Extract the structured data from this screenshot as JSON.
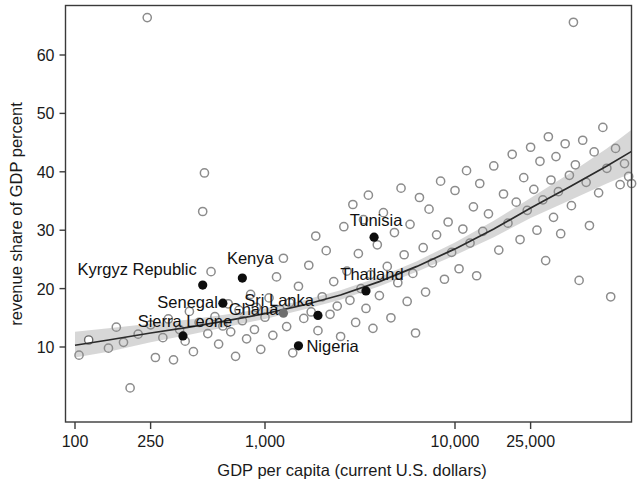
{
  "chart_data": {
    "type": "scatter",
    "title": "",
    "xlabel": "GDP per capita (current U.S. dollars)",
    "ylabel": "revenue share of GDP percent",
    "xscale": "log",
    "yscale": "linear",
    "grid": false,
    "legend": null,
    "xticks": [
      100,
      250,
      1000,
      10000,
      25000
    ],
    "xtick_labels": [
      "100",
      "250",
      "1,000",
      "10,000",
      "25,000"
    ],
    "yticks": [
      10,
      20,
      30,
      40,
      50,
      60
    ],
    "ytick_labels": [
      "10",
      "20",
      "30",
      "40",
      "50",
      "60"
    ],
    "xlim": [
      90,
      90000
    ],
    "ylim": [
      2,
      67
    ],
    "annotations": [
      {
        "label": "Kyrgyz Republic",
        "x": 470,
        "y": 20.6,
        "marker": "solid",
        "label_anchor": "end",
        "label_dx": -6,
        "label_dy": -10
      },
      {
        "label": "Kenya",
        "x": 760,
        "y": 21.8,
        "marker": "solid",
        "label_anchor": "middle",
        "label_dx": 8,
        "label_dy": -14
      },
      {
        "label": "Senegal",
        "x": 600,
        "y": 17.5,
        "marker": "solid",
        "label_anchor": "end",
        "label_dx": -5,
        "label_dy": 5
      },
      {
        "label": "Sierra Leone",
        "x": 370,
        "y": 11.9,
        "marker": "solid",
        "label_anchor": "middle",
        "label_dx": 2,
        "label_dy": -9
      },
      {
        "label": "Ghana",
        "x": 1250,
        "y": 15.8,
        "marker": "gray",
        "label_anchor": "end",
        "label_dx": -5,
        "label_dy": 2
      },
      {
        "label": "Sri Lanka",
        "x": 1900,
        "y": 15.4,
        "marker": "solid",
        "label_anchor": "end",
        "label_dx": -4,
        "label_dy": -9
      },
      {
        "label": "Nigeria",
        "x": 1500,
        "y": 10.2,
        "marker": "solid",
        "label_anchor": "start",
        "label_dx": 8,
        "label_dy": 6
      },
      {
        "label": "Thailand",
        "x": 3400,
        "y": 19.6,
        "marker": "solid",
        "label_anchor": "middle",
        "label_dx": 6,
        "label_dy": -11
      },
      {
        "label": "Tunisia",
        "x": 3750,
        "y": 28.8,
        "marker": "solid",
        "label_anchor": "middle",
        "label_dx": 2,
        "label_dy": -11
      }
    ],
    "fit_line": {
      "description": "fitted regression curve with shaded confidence band",
      "x": [
        100,
        150,
        250,
        400,
        600,
        1000,
        1600,
        2500,
        4000,
        6300,
        10000,
        16000,
        25000,
        40000,
        63000,
        85000
      ],
      "y": [
        10.3,
        11.2,
        12.4,
        13.4,
        14.4,
        15.7,
        17.2,
        18.9,
        21.2,
        23.8,
        26.8,
        30.2,
        33.8,
        37.4,
        41.0,
        43.5
      ],
      "band_upper": [
        12.6,
        13.2,
        14.0,
        14.7,
        15.5,
        16.6,
        18.0,
        19.7,
        22.0,
        24.7,
        27.9,
        31.6,
        35.5,
        39.7,
        44.0,
        47.2
      ],
      "band_lower": [
        8.2,
        9.2,
        10.8,
        12.1,
        13.3,
        14.8,
        16.4,
        18.1,
        20.4,
        22.9,
        25.7,
        28.8,
        32.1,
        35.1,
        38.0,
        39.8
      ]
    },
    "points": [
      {
        "x": 105,
        "y": 8.6,
        "marker": "hollow"
      },
      {
        "x": 118,
        "y": 11.2,
        "marker": "white"
      },
      {
        "x": 150,
        "y": 9.8,
        "marker": "hollow"
      },
      {
        "x": 165,
        "y": 13.4,
        "marker": "hollow"
      },
      {
        "x": 180,
        "y": 10.8,
        "marker": "hollow"
      },
      {
        "x": 195,
        "y": 3.0,
        "marker": "hollow"
      },
      {
        "x": 215,
        "y": 12.2,
        "marker": "hollow"
      },
      {
        "x": 240,
        "y": 66.4,
        "marker": "hollow"
      },
      {
        "x": 250,
        "y": 13.8,
        "marker": "hollow"
      },
      {
        "x": 265,
        "y": 8.2,
        "marker": "hollow"
      },
      {
        "x": 290,
        "y": 11.6,
        "marker": "hollow"
      },
      {
        "x": 310,
        "y": 14.8,
        "marker": "hollow"
      },
      {
        "x": 330,
        "y": 7.8,
        "marker": "hollow"
      },
      {
        "x": 355,
        "y": 13.0,
        "marker": "hollow"
      },
      {
        "x": 380,
        "y": 11.0,
        "marker": "hollow"
      },
      {
        "x": 400,
        "y": 16.1,
        "marker": "hollow"
      },
      {
        "x": 420,
        "y": 9.2,
        "marker": "hollow"
      },
      {
        "x": 450,
        "y": 14.2,
        "marker": "hollow"
      },
      {
        "x": 470,
        "y": 33.2,
        "marker": "hollow"
      },
      {
        "x": 480,
        "y": 39.8,
        "marker": "hollow"
      },
      {
        "x": 500,
        "y": 12.3,
        "marker": "hollow"
      },
      {
        "x": 520,
        "y": 22.9,
        "marker": "hollow"
      },
      {
        "x": 545,
        "y": 15.2,
        "marker": "hollow"
      },
      {
        "x": 570,
        "y": 10.5,
        "marker": "hollow"
      },
      {
        "x": 600,
        "y": 13.6,
        "marker": "hollow"
      },
      {
        "x": 640,
        "y": 17.4,
        "marker": "hollow"
      },
      {
        "x": 660,
        "y": 12.6,
        "marker": "hollow"
      },
      {
        "x": 700,
        "y": 8.4,
        "marker": "hollow"
      },
      {
        "x": 730,
        "y": 16.3,
        "marker": "hollow"
      },
      {
        "x": 760,
        "y": 14.5,
        "marker": "hollow"
      },
      {
        "x": 800,
        "y": 11.4,
        "marker": "hollow"
      },
      {
        "x": 840,
        "y": 19.0,
        "marker": "hollow"
      },
      {
        "x": 880,
        "y": 13.0,
        "marker": "hollow"
      },
      {
        "x": 900,
        "y": 16.8,
        "marker": "hollow"
      },
      {
        "x": 950,
        "y": 9.6,
        "marker": "hollow"
      },
      {
        "x": 1000,
        "y": 15.1,
        "marker": "hollow"
      },
      {
        "x": 1050,
        "y": 18.4,
        "marker": "hollow"
      },
      {
        "x": 1100,
        "y": 12.0,
        "marker": "hollow"
      },
      {
        "x": 1150,
        "y": 22.0,
        "marker": "hollow"
      },
      {
        "x": 1200,
        "y": 16.4,
        "marker": "hollow"
      },
      {
        "x": 1250,
        "y": 25.2,
        "marker": "hollow"
      },
      {
        "x": 1300,
        "y": 13.5,
        "marker": "hollow"
      },
      {
        "x": 1350,
        "y": 17.6,
        "marker": "hollow"
      },
      {
        "x": 1400,
        "y": 9.0,
        "marker": "hollow"
      },
      {
        "x": 1500,
        "y": 20.4,
        "marker": "hollow"
      },
      {
        "x": 1600,
        "y": 14.9,
        "marker": "hollow"
      },
      {
        "x": 1700,
        "y": 24.0,
        "marker": "hollow"
      },
      {
        "x": 1750,
        "y": 16.0,
        "marker": "hollow"
      },
      {
        "x": 1850,
        "y": 29.0,
        "marker": "hollow"
      },
      {
        "x": 1900,
        "y": 12.8,
        "marker": "hollow"
      },
      {
        "x": 2000,
        "y": 18.6,
        "marker": "hollow"
      },
      {
        "x": 2100,
        "y": 26.5,
        "marker": "hollow"
      },
      {
        "x": 2200,
        "y": 15.6,
        "marker": "hollow"
      },
      {
        "x": 2300,
        "y": 21.2,
        "marker": "hollow"
      },
      {
        "x": 2400,
        "y": 17.0,
        "marker": "hollow"
      },
      {
        "x": 2500,
        "y": 11.8,
        "marker": "hollow"
      },
      {
        "x": 2600,
        "y": 30.6,
        "marker": "hollow"
      },
      {
        "x": 2700,
        "y": 23.0,
        "marker": "hollow"
      },
      {
        "x": 2800,
        "y": 18.0,
        "marker": "hollow"
      },
      {
        "x": 2900,
        "y": 34.4,
        "marker": "hollow"
      },
      {
        "x": 3000,
        "y": 14.2,
        "marker": "hollow"
      },
      {
        "x": 3100,
        "y": 26.0,
        "marker": "hollow"
      },
      {
        "x": 3200,
        "y": 20.0,
        "marker": "hollow"
      },
      {
        "x": 3300,
        "y": 31.8,
        "marker": "hollow"
      },
      {
        "x": 3400,
        "y": 16.6,
        "marker": "hollow"
      },
      {
        "x": 3500,
        "y": 36.0,
        "marker": "hollow"
      },
      {
        "x": 3600,
        "y": 22.4,
        "marker": "hollow"
      },
      {
        "x": 3700,
        "y": 13.2,
        "marker": "hollow"
      },
      {
        "x": 3900,
        "y": 27.5,
        "marker": "hollow"
      },
      {
        "x": 4000,
        "y": 18.8,
        "marker": "hollow"
      },
      {
        "x": 4200,
        "y": 33.0,
        "marker": "hollow"
      },
      {
        "x": 4400,
        "y": 23.8,
        "marker": "hollow"
      },
      {
        "x": 4600,
        "y": 15.0,
        "marker": "hollow"
      },
      {
        "x": 4800,
        "y": 29.6,
        "marker": "hollow"
      },
      {
        "x": 5000,
        "y": 21.0,
        "marker": "hollow"
      },
      {
        "x": 5200,
        "y": 37.2,
        "marker": "hollow"
      },
      {
        "x": 5400,
        "y": 25.8,
        "marker": "hollow"
      },
      {
        "x": 5600,
        "y": 17.8,
        "marker": "hollow"
      },
      {
        "x": 5800,
        "y": 31.0,
        "marker": "hollow"
      },
      {
        "x": 6000,
        "y": 22.6,
        "marker": "hollow"
      },
      {
        "x": 6200,
        "y": 12.4,
        "marker": "hollow"
      },
      {
        "x": 6500,
        "y": 35.6,
        "marker": "hollow"
      },
      {
        "x": 6800,
        "y": 27.0,
        "marker": "hollow"
      },
      {
        "x": 7000,
        "y": 19.4,
        "marker": "hollow"
      },
      {
        "x": 7300,
        "y": 33.6,
        "marker": "hollow"
      },
      {
        "x": 7600,
        "y": 24.4,
        "marker": "hollow"
      },
      {
        "x": 8000,
        "y": 29.2,
        "marker": "hollow"
      },
      {
        "x": 8400,
        "y": 38.4,
        "marker": "hollow"
      },
      {
        "x": 8800,
        "y": 21.6,
        "marker": "hollow"
      },
      {
        "x": 9200,
        "y": 31.4,
        "marker": "hollow"
      },
      {
        "x": 9600,
        "y": 26.2,
        "marker": "hollow"
      },
      {
        "x": 10000,
        "y": 36.8,
        "marker": "hollow"
      },
      {
        "x": 10500,
        "y": 23.4,
        "marker": "hollow"
      },
      {
        "x": 11000,
        "y": 30.2,
        "marker": "hollow"
      },
      {
        "x": 11500,
        "y": 40.2,
        "marker": "hollow"
      },
      {
        "x": 12000,
        "y": 27.8,
        "marker": "hollow"
      },
      {
        "x": 12500,
        "y": 34.0,
        "marker": "hollow"
      },
      {
        "x": 13000,
        "y": 22.2,
        "marker": "hollow"
      },
      {
        "x": 13500,
        "y": 38.0,
        "marker": "hollow"
      },
      {
        "x": 14000,
        "y": 29.8,
        "marker": "hollow"
      },
      {
        "x": 15000,
        "y": 32.8,
        "marker": "hollow"
      },
      {
        "x": 16000,
        "y": 41.0,
        "marker": "hollow"
      },
      {
        "x": 17000,
        "y": 26.6,
        "marker": "hollow"
      },
      {
        "x": 18000,
        "y": 36.2,
        "marker": "hollow"
      },
      {
        "x": 19000,
        "y": 31.2,
        "marker": "hollow"
      },
      {
        "x": 20000,
        "y": 43.0,
        "marker": "hollow"
      },
      {
        "x": 21000,
        "y": 34.8,
        "marker": "hollow"
      },
      {
        "x": 22000,
        "y": 28.4,
        "marker": "hollow"
      },
      {
        "x": 23000,
        "y": 39.0,
        "marker": "hollow"
      },
      {
        "x": 24000,
        "y": 33.4,
        "marker": "hollow"
      },
      {
        "x": 25000,
        "y": 44.2,
        "marker": "hollow"
      },
      {
        "x": 26000,
        "y": 37.0,
        "marker": "hollow"
      },
      {
        "x": 27000,
        "y": 30.0,
        "marker": "hollow"
      },
      {
        "x": 28000,
        "y": 41.8,
        "marker": "hollow"
      },
      {
        "x": 29000,
        "y": 35.2,
        "marker": "hollow"
      },
      {
        "x": 30000,
        "y": 24.8,
        "marker": "hollow"
      },
      {
        "x": 31000,
        "y": 46.0,
        "marker": "hollow"
      },
      {
        "x": 32000,
        "y": 38.6,
        "marker": "hollow"
      },
      {
        "x": 33000,
        "y": 32.2,
        "marker": "hollow"
      },
      {
        "x": 34000,
        "y": 42.6,
        "marker": "hollow"
      },
      {
        "x": 35000,
        "y": 36.6,
        "marker": "hollow"
      },
      {
        "x": 36000,
        "y": 29.4,
        "marker": "hollow"
      },
      {
        "x": 38000,
        "y": 44.8,
        "marker": "hollow"
      },
      {
        "x": 40000,
        "y": 39.4,
        "marker": "hollow"
      },
      {
        "x": 41000,
        "y": 34.2,
        "marker": "hollow"
      },
      {
        "x": 42000,
        "y": 65.6,
        "marker": "hollow"
      },
      {
        "x": 43000,
        "y": 41.2,
        "marker": "hollow"
      },
      {
        "x": 45000,
        "y": 21.4,
        "marker": "hollow"
      },
      {
        "x": 47000,
        "y": 45.4,
        "marker": "hollow"
      },
      {
        "x": 49000,
        "y": 38.2,
        "marker": "hollow"
      },
      {
        "x": 51000,
        "y": 30.8,
        "marker": "hollow"
      },
      {
        "x": 54000,
        "y": 43.4,
        "marker": "hollow"
      },
      {
        "x": 57000,
        "y": 36.4,
        "marker": "hollow"
      },
      {
        "x": 60000,
        "y": 47.6,
        "marker": "hollow"
      },
      {
        "x": 63000,
        "y": 40.6,
        "marker": "hollow"
      },
      {
        "x": 66000,
        "y": 18.6,
        "marker": "hollow"
      },
      {
        "x": 70000,
        "y": 44.0,
        "marker": "hollow"
      },
      {
        "x": 74000,
        "y": 37.8,
        "marker": "hollow"
      },
      {
        "x": 78000,
        "y": 41.4,
        "marker": "hollow"
      },
      {
        "x": 82000,
        "y": 39.2,
        "marker": "hollow"
      },
      {
        "x": 85000,
        "y": 38.0,
        "marker": "hollow"
      }
    ]
  }
}
